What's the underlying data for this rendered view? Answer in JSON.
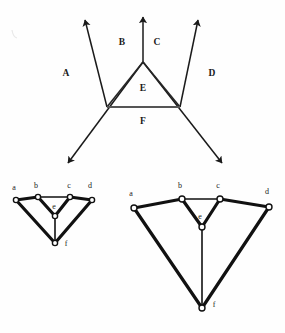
{
  "figure": {
    "background_color": "#fefefe",
    "ink_color": "#1a1a1a",
    "node_fill_color": "#ffffff"
  },
  "top_diagram": {
    "name": "ray-region-diagram",
    "region_labels": [
      {
        "id": "A",
        "text": "A",
        "x": 66,
        "y": 74
      },
      {
        "id": "B",
        "text": "B",
        "x": 122,
        "y": 43
      },
      {
        "id": "C",
        "text": "C",
        "x": 157,
        "y": 43
      },
      {
        "id": "D",
        "text": "D",
        "x": 212,
        "y": 74
      },
      {
        "id": "E",
        "text": "E",
        "x": 143,
        "y": 89
      },
      {
        "id": "F",
        "text": "F",
        "x": 143,
        "y": 122
      }
    ],
    "vertices": {
      "apex": {
        "x": 143,
        "y": 62
      },
      "left_base": {
        "x": 107,
        "y": 107
      },
      "right_base": {
        "x": 180,
        "y": 107
      }
    },
    "rays": [
      {
        "id": "ray-upper-left",
        "from_x": 107,
        "from_y": 107,
        "to_x": 85,
        "to_y": 20
      },
      {
        "id": "ray-upper-middle",
        "from_x": 143,
        "from_y": 62,
        "to_x": 143,
        "to_y": 17
      },
      {
        "id": "ray-upper-right",
        "from_x": 180,
        "from_y": 107,
        "to_x": 198,
        "to_y": 20
      },
      {
        "id": "ray-lower-left",
        "from_x": 143,
        "from_y": 62,
        "to_x": 68,
        "to_y": 163
      },
      {
        "id": "ray-lower-right",
        "from_x": 143,
        "from_y": 62,
        "to_x": 222,
        "to_y": 163
      }
    ],
    "triangle_edges": [
      {
        "id": "edge-apex-left",
        "x1": 143,
        "y1": 62,
        "x2": 107,
        "y2": 107
      },
      {
        "id": "edge-apex-right",
        "x1": 143,
        "y1": 62,
        "x2": 180,
        "y2": 107
      },
      {
        "id": "edge-base",
        "x1": 107,
        "y1": 107,
        "x2": 180,
        "y2": 107
      }
    ]
  },
  "bottom_left_graph": {
    "name": "small-planar-graph",
    "nodes": [
      {
        "id": "a",
        "label": "a",
        "x": 16,
        "y": 200,
        "label_x": 14,
        "label_y": 188
      },
      {
        "id": "b",
        "label": "b",
        "x": 38,
        "y": 197,
        "label_x": 36,
        "label_y": 186
      },
      {
        "id": "c",
        "label": "c",
        "x": 70,
        "y": 197,
        "label_x": 69,
        "label_y": 186
      },
      {
        "id": "d",
        "label": "d",
        "x": 92,
        "y": 200,
        "label_x": 90,
        "label_y": 186
      },
      {
        "id": "e",
        "label": "e",
        "x": 55,
        "y": 216,
        "label_x": 54,
        "label_y": 207
      },
      {
        "id": "f",
        "label": "f",
        "x": 55,
        "y": 243,
        "label_x": 66,
        "label_y": 244
      }
    ],
    "edges": [
      {
        "id": "a-b",
        "from": "a",
        "to": "b",
        "weight": "thick"
      },
      {
        "id": "b-c",
        "from": "b",
        "to": "c",
        "weight": "thin"
      },
      {
        "id": "c-d",
        "from": "c",
        "to": "d",
        "weight": "thick"
      },
      {
        "id": "b-e",
        "from": "b",
        "to": "e",
        "weight": "thick"
      },
      {
        "id": "c-e",
        "from": "c",
        "to": "e",
        "weight": "thick"
      },
      {
        "id": "e-f",
        "from": "e",
        "to": "f",
        "weight": "thin"
      },
      {
        "id": "a-f",
        "from": "a",
        "to": "f",
        "weight": "thick"
      },
      {
        "id": "d-f",
        "from": "d",
        "to": "f",
        "weight": "thick"
      }
    ]
  },
  "bottom_right_graph": {
    "name": "large-planar-graph",
    "nodes": [
      {
        "id": "a",
        "label": "a",
        "x": 134,
        "y": 208,
        "label_x": 131,
        "label_y": 194
      },
      {
        "id": "b",
        "label": "b",
        "x": 182,
        "y": 199,
        "label_x": 180,
        "label_y": 186
      },
      {
        "id": "c",
        "label": "c",
        "x": 220,
        "y": 199,
        "label_x": 218,
        "label_y": 186
      },
      {
        "id": "d",
        "label": "d",
        "x": 269,
        "y": 207,
        "label_x": 267,
        "label_y": 192
      },
      {
        "id": "e",
        "label": "e",
        "x": 202,
        "y": 227,
        "label_x": 200,
        "label_y": 217
      },
      {
        "id": "f",
        "label": "f",
        "x": 202,
        "y": 308,
        "label_x": 214,
        "label_y": 305
      }
    ],
    "edges": [
      {
        "id": "a-b",
        "from": "a",
        "to": "b",
        "weight": "thick"
      },
      {
        "id": "b-c",
        "from": "b",
        "to": "c",
        "weight": "thin"
      },
      {
        "id": "c-d",
        "from": "c",
        "to": "d",
        "weight": "thick"
      },
      {
        "id": "b-e",
        "from": "b",
        "to": "e",
        "weight": "thick"
      },
      {
        "id": "c-e",
        "from": "c",
        "to": "e",
        "weight": "thick"
      },
      {
        "id": "e-f",
        "from": "e",
        "to": "f",
        "weight": "thin"
      },
      {
        "id": "a-f",
        "from": "a",
        "to": "f",
        "weight": "thick"
      },
      {
        "id": "d-f",
        "from": "d",
        "to": "f",
        "weight": "thick"
      }
    ]
  }
}
